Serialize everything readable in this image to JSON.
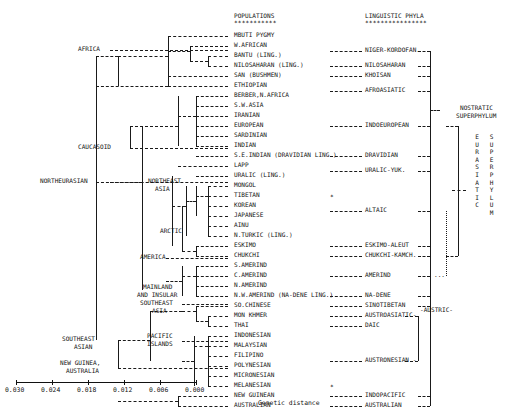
{
  "figure": {
    "title_populations": "POPULATIONS",
    "title_phyla": "LINGUISTIC PHYLA",
    "stars_populations": "***********",
    "stars_phyla": "****************",
    "axis_label": "Genetic distance",
    "axis_ticks": [
      "0.030",
      "0.024",
      "0.018",
      "0.012",
      "0.006",
      "0.000"
    ],
    "nostratic_line1": "NOSTRATIC",
    "nostratic_line2": "SUPERPHYLUM",
    "eurasiatic_vertical": "EURASIATIC",
    "superphylum_vertical": "SUPERPHYLUM",
    "asterisk": "*",
    "dots": "...",
    "austric": "-AUSTRIC-"
  },
  "clusters": [
    {
      "label": "AFRICA",
      "x": 78,
      "y": 50
    },
    {
      "label": "CAUCASOID",
      "x": 78,
      "y": 148
    },
    {
      "label": "NORTHEURASIAN",
      "x": 40,
      "y": 182
    },
    {
      "label": "NORTHEAST",
      "x": 148,
      "y": 182
    },
    {
      "label": "ASIA",
      "x": 155,
      "y": 190
    },
    {
      "label": "ARCTIC",
      "x": 160,
      "y": 232
    },
    {
      "label": "AMERICA",
      "x": 140,
      "y": 258
    },
    {
      "label": "MAINLAND",
      "x": 143,
      "y": 288
    },
    {
      "label": "AND INSULAR",
      "x": 137,
      "y": 296
    },
    {
      "label": "SOUTHEAST",
      "x": 140,
      "y": 304
    },
    {
      "label": "ASIA",
      "x": 152,
      "y": 312
    },
    {
      "label": "SOUTHEAST",
      "x": 62,
      "y": 340
    },
    {
      "label": "ASIAN",
      "x": 74,
      "y": 348
    },
    {
      "label": "PACIFIC",
      "x": 147,
      "y": 337
    },
    {
      "label": "ISLANDS",
      "x": 147,
      "y": 345
    },
    {
      "label": "NEW GUINEA,",
      "x": 60,
      "y": 364
    },
    {
      "label": "AUSTRALIA",
      "x": 66,
      "y": 372
    }
  ],
  "populations": [
    {
      "name": "MBUTI PYGMY",
      "y": 36
    },
    {
      "name": "W.AFRICAN",
      "y": 46
    },
    {
      "name": "BANTU (LING.)",
      "y": 56
    },
    {
      "name": "NILOSAHARAN (LING.)",
      "y": 66
    },
    {
      "name": "SAN (BUSHMEN)",
      "y": 76
    },
    {
      "name": "ETHIOPIAN",
      "y": 86
    },
    {
      "name": "BERBER,N.AFRICA",
      "y": 96
    },
    {
      "name": "S.W.ASIA",
      "y": 106
    },
    {
      "name": "IRANIAN",
      "y": 116
    },
    {
      "name": "EUROPEAN",
      "y": 126
    },
    {
      "name": "SARDINIAN",
      "y": 136
    },
    {
      "name": "INDIAN",
      "y": 146
    },
    {
      "name": "S.E.INDIAN (DRAVIDIAN LING.)",
      "y": 156
    },
    {
      "name": "LAPP",
      "y": 166
    },
    {
      "name": "URALIC (LING.)",
      "y": 176
    },
    {
      "name": "MONGOL",
      "y": 186
    },
    {
      "name": "TIBETAN",
      "y": 196
    },
    {
      "name": "KOREAN",
      "y": 206
    },
    {
      "name": "JAPANESE",
      "y": 216
    },
    {
      "name": "AINU",
      "y": 226
    },
    {
      "name": "N.TURKIC (LING.)",
      "y": 236
    },
    {
      "name": "ESKIMO",
      "y": 246
    },
    {
      "name": "CHUKCHI",
      "y": 256
    },
    {
      "name": "S.AMERIND",
      "y": 266
    },
    {
      "name": "C.AMERIND",
      "y": 276
    },
    {
      "name": "N.AMERIND",
      "y": 286
    },
    {
      "name": "N.W.AMERIND (NA-DENE LING.)",
      "y": 296
    },
    {
      "name": "SO.CHINESE",
      "y": 306
    },
    {
      "name": "MON KHMER",
      "y": 316
    },
    {
      "name": "THAI",
      "y": 326
    },
    {
      "name": "INDONESIAN",
      "y": 336
    },
    {
      "name": "MALAYSIAN",
      "y": 346
    },
    {
      "name": "FILIPINO",
      "y": 356
    },
    {
      "name": "POLYNESIAN",
      "y": 366
    },
    {
      "name": "MICRONESIAN",
      "y": 376
    },
    {
      "name": "MELANESIAN",
      "y": 386
    },
    {
      "name": "NEW GUINEAN",
      "y": 396
    },
    {
      "name": "AUSTRALIAN",
      "y": 406
    }
  ],
  "phyla": [
    {
      "name": "NIGER-KORDOFAN.",
      "y": 51
    },
    {
      "name": "NILOSAHARAN",
      "y": 66
    },
    {
      "name": "KHOISAN",
      "y": 76
    },
    {
      "name": "AFROASIATIC",
      "y": 91
    },
    {
      "name": "INDOEUROPEAN",
      "y": 126
    },
    {
      "name": "DRAVIDIAN",
      "y": 156
    },
    {
      "name": "URALIC-YUK.",
      "y": 171
    },
    {
      "name": "ALTAIC",
      "y": 211
    },
    {
      "name": "ESKIMO-ALEUT",
      "y": 246
    },
    {
      "name": "CHUKCHI-KAMCH.",
      "y": 256
    },
    {
      "name": "AMERIND",
      "y": 276
    },
    {
      "name": "NA-DENE",
      "y": 296
    },
    {
      "name": "SINOTIBETAN",
      "y": 306
    },
    {
      "name": "AUSTROASIATIC-",
      "y": 316
    },
    {
      "name": "DAIC",
      "y": 326
    },
    {
      "name": "AUSTRONESIAN -",
      "y": 361
    },
    {
      "name": "INDOPACIFIC",
      "y": 396
    },
    {
      "name": "AUSTRALIAN",
      "y": 406
    }
  ],
  "chart_data": {
    "type": "dendrogram",
    "xlabel": "Genetic distance",
    "xlim": [
      0.03,
      0.0
    ],
    "x_ticks": [
      0.03,
      0.024,
      0.018,
      0.012,
      0.006,
      0.0
    ],
    "grid": false,
    "legend": "none",
    "leaves": [
      "MBUTI PYGMY",
      "W.AFRICAN",
      "BANTU (LING.)",
      "NILOSAHARAN (LING.)",
      "SAN (BUSHMEN)",
      "ETHIOPIAN",
      "BERBER,N.AFRICA",
      "S.W.ASIA",
      "IRANIAN",
      "EUROPEAN",
      "SARDINIAN",
      "INDIAN",
      "S.E.INDIAN (DRAVIDIAN LING.)",
      "LAPP",
      "URALIC (LING.)",
      "MONGOL",
      "TIBETAN",
      "KOREAN",
      "JAPANESE",
      "AINU",
      "N.TURKIC (LING.)",
      "ESKIMO",
      "CHUKCHI",
      "S.AMERIND",
      "C.AMERIND",
      "N.AMERIND",
      "N.W.AMERIND (NA-DENE LING.)",
      "SO.CHINESE",
      "MON KHMER",
      "THAI",
      "INDONESIAN",
      "MALAYSIAN",
      "FILIPINO",
      "POLYNESIAN",
      "MICRONESIAN",
      "MELANESIAN",
      "NEW GUINEAN",
      "AUSTRALIAN"
    ],
    "superclusters": [
      {
        "name": "AFRICA",
        "merge_distance": 0.03
      },
      {
        "name": "CAUCASOID",
        "merge_distance": 0.016
      },
      {
        "name": "NORTHEURASIAN",
        "merge_distance": 0.022
      },
      {
        "name": "NORTHEAST ASIA",
        "merge_distance": 0.012
      },
      {
        "name": "ARCTIC",
        "merge_distance": 0.01
      },
      {
        "name": "AMERICA",
        "merge_distance": 0.013
      },
      {
        "name": "MAINLAND AND INSULAR SOUTHEAST ASIA",
        "merge_distance": 0.013
      },
      {
        "name": "PACIFIC ISLANDS",
        "merge_distance": 0.012
      },
      {
        "name": "SOUTHEAST ASIAN",
        "merge_distance": 0.019
      },
      {
        "name": "NEW GUINEA, AUSTRALIA",
        "merge_distance": 0.019
      }
    ],
    "phyla_groups": [
      "NIGER-KORDOFAN.",
      "NILOSAHARAN",
      "KHOISAN",
      "AFROASIATIC",
      "INDOEUROPEAN",
      "DRAVIDIAN",
      "URALIC-YUK.",
      "ALTAIC",
      "ESKIMO-ALEUT",
      "CHUKCHI-KAMCH.",
      "AMERIND",
      "NA-DENE",
      "SINOTIBETAN",
      "AUSTROASIATIC-",
      "DAIC",
      "AUSTRONESIAN -",
      "INDOPACIFIC",
      "AUSTRALIAN"
    ],
    "superphyla": [
      "NOSTRATIC SUPERPHYLUM",
      "EURASIATIC SUPERPHYLUM",
      "AUSTRIC"
    ]
  }
}
